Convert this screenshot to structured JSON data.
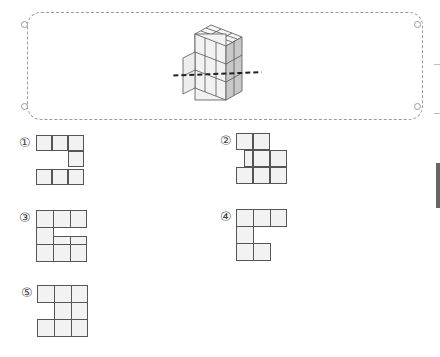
{
  "options": [
    {
      "label": "①",
      "cells": [
        [
          0,
          0
        ],
        [
          1,
          0
        ],
        [
          2,
          0
        ],
        [
          2,
          1
        ],
        [
          0,
          2
        ],
        [
          1,
          2
        ],
        [
          2,
          2
        ]
      ]
    },
    {
      "label": "②",
      "cells": [
        [
          0,
          0
        ],
        [
          1,
          0
        ],
        [
          0.5,
          1
        ],
        [
          1.5,
          1
        ],
        [
          2.5,
          1
        ],
        [
          0,
          2
        ],
        [
          1,
          2
        ],
        [
          2,
          2
        ]
      ]
    },
    {
      "label": "③",
      "cells": [
        [
          0,
          0
        ],
        [
          1,
          0
        ],
        [
          2,
          0
        ],
        [
          0,
          1
        ],
        [
          1,
          1.5
        ],
        [
          2,
          1.5
        ],
        [
          0,
          2
        ],
        [
          1,
          2
        ],
        [
          2,
          2
        ]
      ]
    },
    {
      "label": "④",
      "cells": [
        [
          0,
          0
        ],
        [
          1,
          0
        ],
        [
          2,
          0
        ],
        [
          0,
          1
        ],
        [
          0,
          2
        ],
        [
          1,
          2
        ]
      ]
    },
    {
      "label": "⑤",
      "cells": [
        [
          0,
          0
        ],
        [
          1,
          0
        ],
        [
          2,
          0
        ],
        [
          1,
          1
        ],
        [
          2,
          1
        ],
        [
          0,
          2
        ],
        [
          1,
          2
        ],
        [
          2,
          2
        ]
      ]
    }
  ]
}
